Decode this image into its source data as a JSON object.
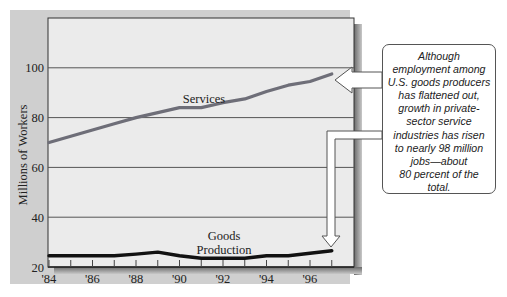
{
  "chart_data": {
    "type": "line",
    "title": "",
    "xlabel": "",
    "ylabel": "Millions of Workers",
    "ylim": [
      20,
      115
    ],
    "xlim": [
      1984,
      1997
    ],
    "grid": true,
    "x_tick_labels": [
      "'84",
      "'86",
      "'88",
      "'90",
      "'92",
      "'94",
      "'96"
    ],
    "y_tick_labels": [
      "20",
      "40",
      "60",
      "80",
      "100"
    ],
    "x": [
      1984,
      1985,
      1986,
      1987,
      1988,
      1989,
      1990,
      1991,
      1992,
      1993,
      1994,
      1995,
      1996,
      1997
    ],
    "series": [
      {
        "name": "Services",
        "label": "Services",
        "color": "#6e6e78",
        "values": [
          70,
          72.5,
          75,
          77.5,
          80,
          82,
          84,
          84,
          86,
          87.5,
          90.5,
          93,
          94.5,
          97.5
        ]
      },
      {
        "name": "Goods Production",
        "label_line1": "Goods",
        "label_line2": "Production",
        "color": "#111111",
        "values": [
          24.5,
          24.5,
          24.5,
          24.5,
          25.2,
          26,
          24.5,
          23.5,
          23.5,
          23.5,
          24.5,
          24.5,
          25.5,
          26.5
        ]
      }
    ],
    "annotations": [
      {
        "type": "callout",
        "lines": [
          "Although",
          "employment among",
          "U.S. goods producers",
          "has flattened out,",
          "growth in private-",
          "sector service",
          "industries has risen",
          "to nearly 98 million",
          "jobs—about",
          "80 percent of the",
          "total."
        ],
        "arrows_to": [
          "Services 1997 endpoint",
          "Goods Production 1997 endpoint"
        ]
      }
    ]
  },
  "colors": {
    "frame": "#cfcfcf",
    "plot_bg": "#ebebeb",
    "grid": "#555555",
    "services_line": "#6e6e78",
    "goods_line": "#111111"
  }
}
